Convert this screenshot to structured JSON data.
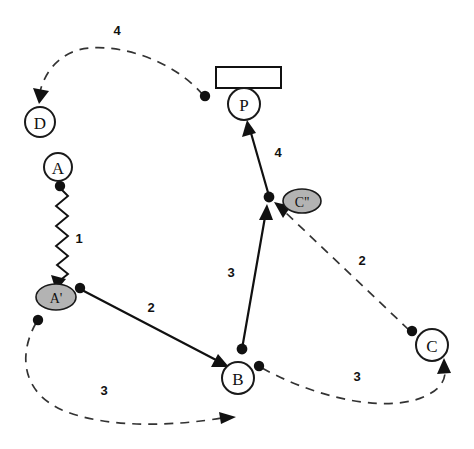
{
  "diagram": {
    "type": "node-link-graph",
    "canvas": {
      "width": 474,
      "height": 449,
      "background": "#ffffff"
    },
    "colors": {
      "stroke": "#111111",
      "node_fill": "#ffffff",
      "transformed_node_fill": "#b3b3b3",
      "dashed_stroke": "#333333"
    },
    "nodes": [
      {
        "id": "D",
        "label": "D",
        "shape": "circle",
        "cx": 40,
        "cy": 122,
        "r": 15,
        "style": "plain"
      },
      {
        "id": "A",
        "label": "A",
        "shape": "circle",
        "cx": 58,
        "cy": 167,
        "r": 14,
        "style": "plain"
      },
      {
        "id": "Ap",
        "label": "A'",
        "shape": "ellipse",
        "cx": 56,
        "cy": 297,
        "rx": 20,
        "ry": 13,
        "style": "shaded"
      },
      {
        "id": "B",
        "label": "B",
        "shape": "circle",
        "cx": 238,
        "cy": 378,
        "r": 16,
        "style": "plain"
      },
      {
        "id": "C",
        "label": "C",
        "shape": "circle",
        "cx": 432,
        "cy": 345,
        "r": 16,
        "style": "plain"
      },
      {
        "id": "Cpp",
        "label": "C''",
        "shape": "ellipse",
        "cx": 302,
        "cy": 201,
        "rx": 19,
        "ry": 12,
        "style": "shaded"
      },
      {
        "id": "P",
        "label": "P",
        "shape": "circle",
        "cx": 244,
        "cy": 104,
        "r": 16,
        "style": "plain"
      }
    ],
    "shapes": [
      {
        "id": "bar",
        "kind": "rectangle",
        "x": 216,
        "y": 67,
        "width": 65,
        "height": 21,
        "label": ""
      }
    ],
    "edges": [
      {
        "id": "e-A-Ap",
        "from": "A",
        "to": "Ap",
        "line": "zigzag",
        "weight": "1",
        "label_x": 79,
        "label_y": 238
      },
      {
        "id": "e-Ap-B",
        "from": "A'",
        "to": "B",
        "line": "solid",
        "weight": "2",
        "label_x": 151,
        "label_y": 307
      },
      {
        "id": "e-B-Cpp",
        "from": "B",
        "to": "C''",
        "line": "solid",
        "weight": "3",
        "label_x": 231,
        "label_y": 272
      },
      {
        "id": "e-Cpp-P",
        "from": "C''",
        "to": "P",
        "line": "solid",
        "weight": "4",
        "label_x": 278,
        "label_y": 152
      },
      {
        "id": "e-P-D",
        "from": "P",
        "to": "D",
        "line": "dashed",
        "weight": "4",
        "label_x": 117,
        "label_y": 30
      },
      {
        "id": "e-C-Cpp",
        "from": "C",
        "to": "C''",
        "line": "dashed",
        "weight": "2",
        "label_x": 362,
        "label_y": 260
      },
      {
        "id": "e-Ap-Bd",
        "from": "A'",
        "to": "B",
        "line": "dashed",
        "weight": "3",
        "label_x": 104,
        "label_y": 390
      },
      {
        "id": "e-B-Cd",
        "from": "B",
        "to": "C",
        "line": "dashed",
        "weight": "3",
        "label_x": 357,
        "label_y": 376
      }
    ],
    "endpoint_dots": [
      {
        "id": "dot-A-bottom",
        "cx": 60,
        "cy": 186
      },
      {
        "id": "dot-Ap-right",
        "cx": 80,
        "cy": 288
      },
      {
        "id": "dot-Ap-below",
        "cx": 38,
        "cy": 320
      },
      {
        "id": "dot-B-top",
        "cx": 242,
        "cy": 350
      },
      {
        "id": "dot-B-right",
        "cx": 259,
        "cy": 366
      },
      {
        "id": "dot-Cpp-left",
        "cx": 269,
        "cy": 198
      },
      {
        "id": "dot-C-upleft",
        "cx": 412,
        "cy": 332
      },
      {
        "id": "dot-near-bar",
        "cx": 205,
        "cy": 96
      }
    ]
  }
}
